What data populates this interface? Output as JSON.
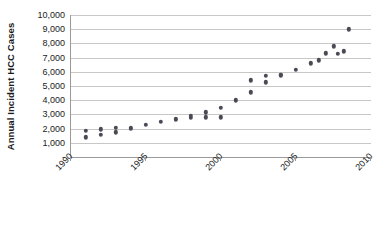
{
  "chart_data": {
    "type": "scatter",
    "title": "",
    "xlabel": "",
    "ylabel": "Annual Incident HCC Cases",
    "xlim": [
      1990,
      2010
    ],
    "ylim": [
      0,
      10000
    ],
    "grid": true,
    "legend": "none",
    "y_tick_labels": [
      "10,000",
      "9,000",
      "8,000",
      "7,000",
      "6,000",
      "5,000",
      "4,000",
      "3,000",
      "2,000",
      "1,000",
      "-"
    ],
    "y_tick_values": [
      10000,
      9000,
      8000,
      7000,
      6000,
      5000,
      4000,
      3000,
      2000,
      1000,
      0
    ],
    "x_tick_labels": [
      "1990",
      "1995",
      "2000",
      "2005",
      "2010"
    ],
    "x_tick_values": [
      1990,
      1995,
      2000,
      2005,
      2010
    ],
    "marker_color": "#4a4a55",
    "gridline_color": "#c7c7c7",
    "axis_color": "#9a9a9a",
    "points": [
      {
        "x": 1991.0,
        "y": 1850
      },
      {
        "x": 1991.0,
        "y": 1400
      },
      {
        "x": 1992.0,
        "y": 1950
      },
      {
        "x": 1992.0,
        "y": 1550
      },
      {
        "x": 1993.0,
        "y": 2050
      },
      {
        "x": 1993.0,
        "y": 1750
      },
      {
        "x": 1994.0,
        "y": 2050
      },
      {
        "x": 1994.0,
        "y": 2000
      },
      {
        "x": 1995.0,
        "y": 2250
      },
      {
        "x": 1996.0,
        "y": 2500
      },
      {
        "x": 1997.0,
        "y": 2700
      },
      {
        "x": 1997.0,
        "y": 2600
      },
      {
        "x": 1998.0,
        "y": 2900
      },
      {
        "x": 1998.0,
        "y": 2750
      },
      {
        "x": 1999.0,
        "y": 3150
      },
      {
        "x": 1999.0,
        "y": 2800
      },
      {
        "x": 2000.0,
        "y": 3450
      },
      {
        "x": 2000.0,
        "y": 2800
      },
      {
        "x": 2001.0,
        "y": 4000
      },
      {
        "x": 2002.0,
        "y": 4550
      },
      {
        "x": 2002.0,
        "y": 5400
      },
      {
        "x": 2003.0,
        "y": 5250
      },
      {
        "x": 2003.0,
        "y": 5700
      },
      {
        "x": 2004.0,
        "y": 5750
      },
      {
        "x": 2004.0,
        "y": 5800
      },
      {
        "x": 2005.0,
        "y": 6150
      },
      {
        "x": 2006.0,
        "y": 6600
      },
      {
        "x": 2006.5,
        "y": 6800
      },
      {
        "x": 2007.0,
        "y": 7300
      },
      {
        "x": 2007.5,
        "y": 7800
      },
      {
        "x": 2007.8,
        "y": 7250
      },
      {
        "x": 2008.2,
        "y": 7450
      },
      {
        "x": 2008.5,
        "y": 9000
      }
    ]
  }
}
